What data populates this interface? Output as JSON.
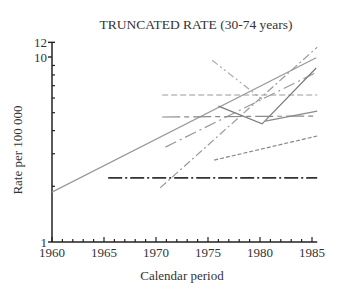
{
  "chart_data": {
    "type": "line",
    "title": "TRUNCATED RATE (30-74 years)",
    "xlabel": "Calendar period",
    "ylabel": "Rate per 100 000",
    "xlim": [
      1960,
      1985.5
    ],
    "ylim": [
      1,
      12
    ],
    "yscale": "log",
    "xticks": [
      1960,
      1965,
      1970,
      1975,
      1980,
      1985
    ],
    "yticks": [
      1,
      10,
      12
    ],
    "grid": false,
    "legend": "none",
    "series": [
      {
        "name": "series-solid-long",
        "style": "solid",
        "color": "#999999",
        "width": 1.2,
        "points": [
          [
            1960,
            1.86
          ],
          [
            1985.4,
            9.9
          ]
        ]
      },
      {
        "name": "series-longdash-dot-rising",
        "style": "longdashdot",
        "color": "#999999",
        "width": 1.2,
        "points": [
          [
            1970.9,
            3.26
          ],
          [
            1985.5,
            8.3
          ]
        ]
      },
      {
        "name": "series-dashdot-steep",
        "style": "dashdot",
        "color": "#9a9a9a",
        "width": 1.2,
        "points": [
          [
            1970.4,
            1.96
          ],
          [
            1985.5,
            11.3
          ]
        ]
      },
      {
        "name": "series-dashdotdot-descending",
        "style": "dashdotdot",
        "color": "#aaaaaa",
        "width": 1.2,
        "points": [
          [
            1975.4,
            9.6
          ],
          [
            1980.2,
            5.9
          ]
        ]
      },
      {
        "name": "series-dashed-flat",
        "style": "dashed",
        "color": "#999999",
        "width": 1.2,
        "points": [
          [
            1970.6,
            6.23
          ],
          [
            1985.5,
            6.23
          ]
        ]
      },
      {
        "name": "series-longshort-flat",
        "style": "longshort",
        "color": "#8a8a8a",
        "width": 1.2,
        "points": [
          [
            1970.6,
            4.74
          ],
          [
            1985.5,
            4.8
          ]
        ]
      },
      {
        "name": "series-solid-v",
        "style": "solid",
        "color": "#7a7a7a",
        "width": 1.2,
        "points": [
          [
            1976.0,
            5.43
          ],
          [
            1980.2,
            4.35
          ],
          [
            1985.4,
            8.72
          ]
        ]
      },
      {
        "name": "series-solid-short",
        "style": "solid",
        "color": "#8a8a8a",
        "width": 1.2,
        "points": [
          [
            1980.5,
            4.5
          ],
          [
            1985.5,
            5.1
          ]
        ]
      },
      {
        "name": "series-shortdash-rising",
        "style": "shortdash",
        "color": "#888888",
        "width": 1.2,
        "points": [
          [
            1975.6,
            2.77
          ],
          [
            1985.5,
            3.74
          ]
        ]
      },
      {
        "name": "series-dashdot-bottom",
        "style": "dashdot-thick",
        "color": "#333333",
        "width": 1.8,
        "points": [
          [
            1965.4,
            2.22
          ],
          [
            1985.5,
            2.22
          ]
        ]
      }
    ]
  }
}
